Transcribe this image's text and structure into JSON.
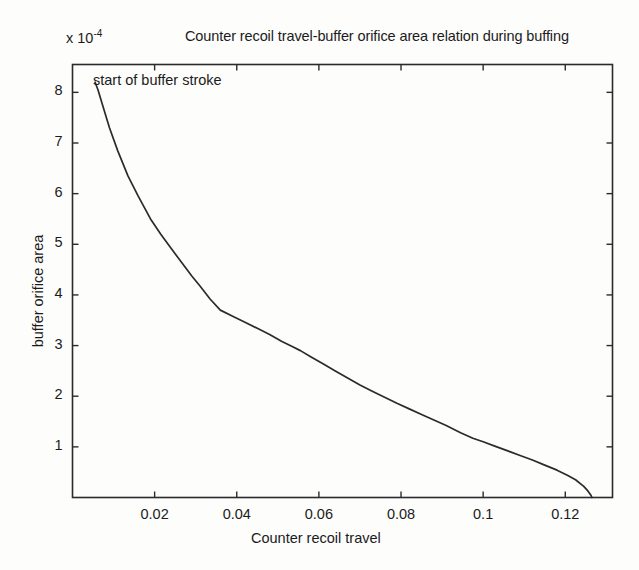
{
  "figure": {
    "background_color": "#fdfdfc",
    "line_color": "#2b2b2b",
    "axis_color": "#2b2b2b"
  },
  "chart_data": {
    "type": "line",
    "title": "Counter recoil travel-buffer orifice area relation during buffing",
    "xlabel": "Counter recoil travel",
    "ylabel": "buffer orifice area",
    "y_exponent_prefix": "x 10",
    "y_exponent_value": "-4",
    "y_scale_note": "x 10^-4",
    "grid": false,
    "legend": null,
    "xlim": [
      0.0,
      0.1315
    ],
    "ylim": [
      0.0,
      8.55
    ],
    "y_units": "1e-4",
    "xticks": [
      0.02,
      0.04,
      0.06,
      0.08,
      0.1,
      0.12
    ],
    "xtick_labels": [
      "0.02",
      "0.04",
      "0.06",
      "0.08",
      "0.1",
      "0.12"
    ],
    "yticks": [
      1,
      2,
      3,
      4,
      5,
      6,
      7,
      8
    ],
    "ytick_labels": [
      "1",
      "2",
      "3",
      "4",
      "5",
      "6",
      "7",
      "8"
    ],
    "annotations": [
      {
        "text": "start of buffer stroke",
        "x": 0.0105,
        "y": 8.0
      }
    ],
    "series": [
      {
        "name": "buffer orifice area",
        "x": [
          0.0055,
          0.0062,
          0.0075,
          0.009,
          0.011,
          0.0135,
          0.016,
          0.019,
          0.0215,
          0.024,
          0.0265,
          0.029,
          0.031,
          0.0335,
          0.036,
          0.039,
          0.042,
          0.045,
          0.048,
          0.051,
          0.0535,
          0.0555,
          0.058,
          0.061,
          0.064,
          0.067,
          0.07,
          0.073,
          0.076,
          0.079,
          0.082,
          0.085,
          0.088,
          0.091,
          0.0945,
          0.0975,
          0.1,
          0.103,
          0.106,
          0.109,
          0.112,
          0.115,
          0.118,
          0.1205,
          0.1225,
          0.1245,
          0.1255,
          0.1262,
          0.1265
        ],
        "y": [
          8.2,
          8.05,
          7.7,
          7.3,
          6.85,
          6.35,
          5.95,
          5.5,
          5.2,
          4.92,
          4.65,
          4.38,
          4.18,
          3.92,
          3.7,
          3.58,
          3.46,
          3.34,
          3.22,
          3.08,
          2.98,
          2.9,
          2.78,
          2.64,
          2.5,
          2.36,
          2.22,
          2.1,
          1.98,
          1.86,
          1.75,
          1.64,
          1.53,
          1.42,
          1.28,
          1.17,
          1.1,
          1.01,
          0.92,
          0.83,
          0.74,
          0.64,
          0.54,
          0.44,
          0.35,
          0.22,
          0.13,
          0.05,
          0.0
        ]
      }
    ]
  }
}
